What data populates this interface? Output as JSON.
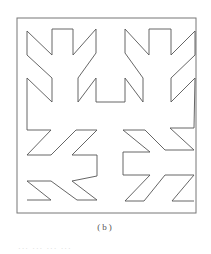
{
  "figure": {
    "caption": "(b)",
    "footer_text": "··· ··· ··· ···",
    "stroke_color": "#555555",
    "border_color": "#777777",
    "border": {
      "x": 17,
      "y": 18,
      "width": 179,
      "height": 195
    },
    "curve_points": [
      [
        27,
        200
      ],
      [
        51,
        200
      ],
      [
        27,
        181
      ],
      [
        51,
        181
      ],
      [
        77,
        200
      ],
      [
        97,
        200
      ],
      [
        72,
        181
      ],
      [
        97,
        176
      ],
      [
        97,
        155
      ],
      [
        72,
        155
      ],
      [
        97,
        130
      ],
      [
        76,
        130
      ],
      [
        51,
        155
      ],
      [
        27,
        155
      ],
      [
        51,
        130
      ],
      [
        27,
        130
      ],
      [
        27,
        78
      ],
      [
        52,
        102
      ],
      [
        52,
        78
      ],
      [
        27,
        55
      ],
      [
        27,
        31
      ],
      [
        52,
        55
      ],
      [
        52,
        29
      ],
      [
        73,
        29
      ],
      [
        73,
        55
      ],
      [
        96,
        29
      ],
      [
        96,
        53
      ],
      [
        78,
        78
      ],
      [
        78,
        102
      ],
      [
        96,
        78
      ],
      [
        96,
        102
      ],
      [
        125,
        102
      ],
      [
        125,
        78
      ],
      [
        143,
        102
      ],
      [
        143,
        78
      ],
      [
        125,
        53
      ],
      [
        125,
        29
      ],
      [
        149,
        55
      ],
      [
        149,
        29
      ],
      [
        171,
        29
      ],
      [
        171,
        55
      ],
      [
        195,
        31
      ],
      [
        195,
        55
      ],
      [
        171,
        78
      ],
      [
        171,
        102
      ],
      [
        195,
        78
      ],
      [
        194,
        128
      ],
      [
        170,
        128
      ],
      [
        194,
        150
      ],
      [
        165,
        150
      ],
      [
        145,
        130
      ],
      [
        123,
        130
      ],
      [
        150,
        152
      ],
      [
        123,
        152
      ],
      [
        123,
        175
      ],
      [
        150,
        175
      ],
      [
        125,
        201
      ],
      [
        144,
        201
      ],
      [
        165,
        175
      ],
      [
        194,
        175
      ],
      [
        172,
        201
      ],
      [
        194,
        201
      ]
    ]
  }
}
